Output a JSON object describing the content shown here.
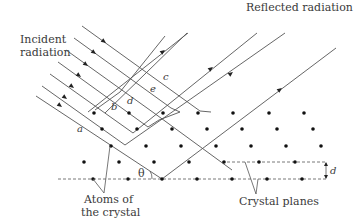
{
  "labels": {
    "incident_line1": "Incident",
    "incident_line2": "radiation",
    "reflected": "Reflected radiation",
    "atoms_line1": "Atoms of",
    "atoms_line2": "the crystal",
    "crystal_planes": "Crystal planes",
    "theta": "θ",
    "spacing": "d",
    "ray_a": "a",
    "ray_b": "b",
    "ray_c": "c",
    "ray_d": "d",
    "ray_e": "e"
  },
  "colors": {
    "line": "#555555",
    "atom": "#111111",
    "text": "#3a3a3a"
  }
}
